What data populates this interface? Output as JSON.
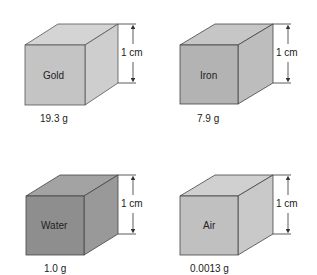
{
  "cubes": [
    {
      "name": "Gold",
      "mass": "19.3 g",
      "dimension": "1 cm",
      "front": "#c4c4c4",
      "top": "#d4d4d4",
      "side": "#cecece"
    },
    {
      "name": "Iron",
      "mass": "7.9 g",
      "dimension": "1 cm",
      "front": "#b3b3b3",
      "top": "#c6c6c6",
      "side": "#bdbdbd"
    },
    {
      "name": "Water",
      "mass": "1.0 g",
      "dimension": "1 cm",
      "front": "#8e8e8e",
      "top": "#a3a3a3",
      "side": "#999999"
    },
    {
      "name": "Air",
      "mass": "0.0013 g",
      "dimension": "1 cm",
      "front": "#c0c0c0",
      "top": "#d0d0d0",
      "side": "#c9c9c9"
    }
  ]
}
